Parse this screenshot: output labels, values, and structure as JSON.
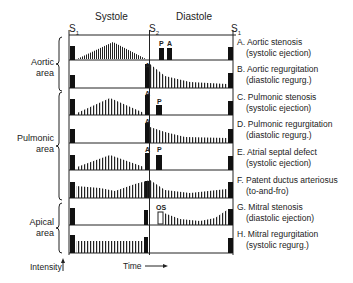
{
  "header": {
    "systole": "Systole",
    "diastole": "Diastole",
    "s1_left": "S",
    "s2": "S",
    "s1_right": "S",
    "sub1": "1",
    "sub2": "2"
  },
  "areas": [
    {
      "label_line1": "Aortic",
      "label_line2": "area"
    },
    {
      "label_line1": "Pulmonic",
      "label_line2": "area"
    },
    {
      "label_line1": "Apical",
      "label_line2": "area"
    }
  ],
  "rows": [
    {
      "id": "A",
      "title": "A. Aortic stenosis",
      "subtitle": "(systolic ejection)"
    },
    {
      "id": "B",
      "title": "B. Aortic regurgitation",
      "subtitle": "(diastolic regurg.)"
    },
    {
      "id": "C",
      "title": "C. Pulmonic stenosis",
      "subtitle": "(systolic ejection)"
    },
    {
      "id": "D",
      "title": "D. Pulmonic regurgitation",
      "subtitle": "(diastolic regurg.)"
    },
    {
      "id": "E",
      "title": "E. Atrial septal defect",
      "subtitle": "(systolic ejection)"
    },
    {
      "id": "F",
      "title": "F. Patent ductus arteriosus",
      "subtitle": "(to-and-fro)"
    },
    {
      "id": "G",
      "title": "G. Mitral stenosis",
      "subtitle": "(diastolic ejection)"
    },
    {
      "id": "H",
      "title": "H. Mitral regurgitation",
      "subtitle": "(systolic regurg.)"
    }
  ],
  "markers": {
    "A": "A",
    "P": "P",
    "OS": "OS"
  },
  "axes": {
    "intensity": "Intensity",
    "time": "Time"
  }
}
